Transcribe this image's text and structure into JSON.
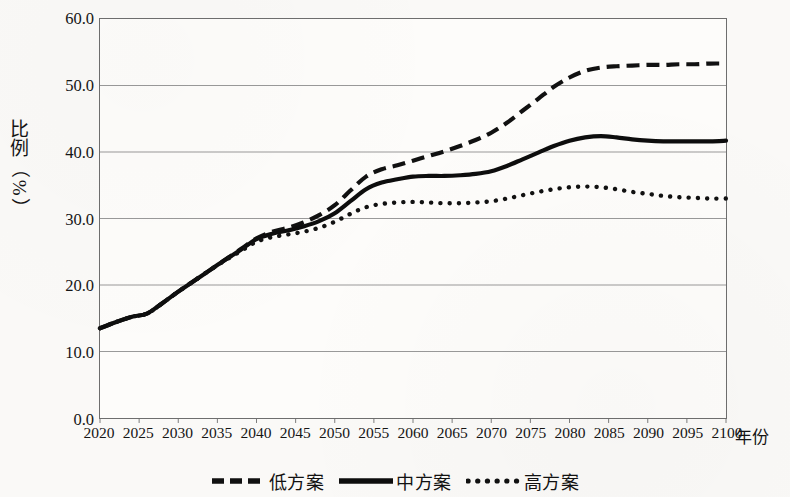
{
  "chart_data": {
    "type": "line",
    "title": "",
    "xlabel": "年份",
    "ylabel": "比例（%）",
    "ylabel_chars": [
      "比",
      "例",
      "（",
      "%",
      "）"
    ],
    "xlim": [
      2020,
      2100
    ],
    "ylim": [
      0.0,
      60.0
    ],
    "grid": true,
    "grid_axis": "y",
    "legend_position": "bottom-center",
    "y_ticks": [
      "0.0",
      "10.0",
      "20.0",
      "30.0",
      "40.0",
      "50.0",
      "60.0"
    ],
    "y_tick_values": [
      0.0,
      10.0,
      20.0,
      30.0,
      40.0,
      50.0,
      60.0
    ],
    "x_ticks": [
      "2020",
      "2025",
      "2030",
      "2035",
      "2040",
      "2045",
      "2050",
      "2055",
      "2060",
      "2065",
      "2070",
      "2075",
      "2080",
      "2085",
      "2090",
      "2095",
      "2100"
    ],
    "x": [
      2020,
      2022,
      2024,
      2026,
      2028,
      2030,
      2032,
      2034,
      2036,
      2038,
      2040,
      2042,
      2044,
      2046,
      2048,
      2050,
      2052,
      2054,
      2056,
      2058,
      2060,
      2062,
      2064,
      2066,
      2068,
      2070,
      2072,
      2074,
      2076,
      2078,
      2080,
      2082,
      2084,
      2086,
      2088,
      2090,
      2092,
      2094,
      2096,
      2098,
      2100
    ],
    "series": [
      {
        "name": "低方案",
        "style": "dashed",
        "color": "#111111",
        "values": [
          13.5,
          14.4,
          15.2,
          15.7,
          17.3,
          19.0,
          20.6,
          22.2,
          23.8,
          25.4,
          27.0,
          28.0,
          28.6,
          29.4,
          30.5,
          32.0,
          34.2,
          36.3,
          37.4,
          38.0,
          38.7,
          39.4,
          40.1,
          40.9,
          41.8,
          42.9,
          44.4,
          46.2,
          48.0,
          49.8,
          51.2,
          52.2,
          52.7,
          52.9,
          53.0,
          53.1,
          53.1,
          53.2,
          53.2,
          53.3,
          53.3
        ]
      },
      {
        "name": "中方案",
        "style": "solid",
        "color": "#0d0d0d",
        "values": [
          13.5,
          14.4,
          15.2,
          15.7,
          17.3,
          19.0,
          20.6,
          22.2,
          23.8,
          25.3,
          26.9,
          27.7,
          28.2,
          28.8,
          29.6,
          30.8,
          32.6,
          34.4,
          35.4,
          35.9,
          36.3,
          36.4,
          36.4,
          36.5,
          36.7,
          37.1,
          37.9,
          38.9,
          39.9,
          40.9,
          41.7,
          42.2,
          42.4,
          42.2,
          41.9,
          41.7,
          41.6,
          41.6,
          41.6,
          41.6,
          41.7
        ]
      },
      {
        "name": "高方案",
        "style": "dotted",
        "color": "#111111",
        "values": [
          13.5,
          14.4,
          15.2,
          15.7,
          17.3,
          19.0,
          20.6,
          22.2,
          23.7,
          25.1,
          26.5,
          27.2,
          27.6,
          28.0,
          28.6,
          29.5,
          30.7,
          31.7,
          32.2,
          32.4,
          32.5,
          32.4,
          32.3,
          32.3,
          32.4,
          32.6,
          33.0,
          33.5,
          34.0,
          34.4,
          34.7,
          34.8,
          34.7,
          34.4,
          34.0,
          33.7,
          33.4,
          33.2,
          33.1,
          33.0,
          33.0
        ]
      }
    ]
  },
  "legend": {
    "items": [
      {
        "label": "低方案",
        "marker": "dashed-line-swatch"
      },
      {
        "label": "中方案",
        "marker": "solid-line-swatch"
      },
      {
        "label": "高方案",
        "marker": "dotted-line-swatch"
      }
    ]
  }
}
